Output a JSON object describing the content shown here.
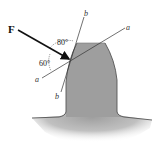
{
  "figure": {
    "force_label": "F",
    "angle_between_F_and_b": "80°",
    "angle_between_F_and_a": "60°",
    "axis_a_label_upper": "a",
    "axis_a_label_lower": "a",
    "axis_b_label_upper": "b",
    "axis_b_label_lower": "b"
  },
  "colors": {
    "tooth_fill": "#9e9e9e",
    "tooth_outline": "#555555",
    "line": "#333333",
    "arrow": "#111111",
    "background": "#ffffff"
  }
}
